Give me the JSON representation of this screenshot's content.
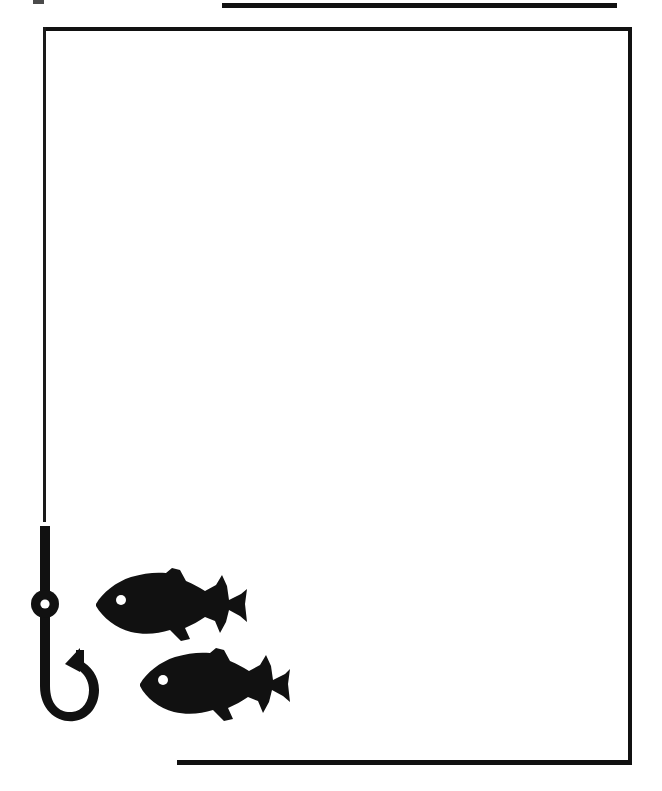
{
  "artwork": {
    "title": "Fishing Page Border",
    "subject": "Fishing hook and two fish silhouettes framing a blank page",
    "style": "black-and-white scanned clip art",
    "medium": "line art silhouette",
    "background_color": "#ffffff",
    "ink_color": "#111111",
    "canvas": {
      "width": 662,
      "height": 791
    }
  },
  "frame": {
    "top_rule": {
      "label": "top horizontal rule",
      "x1": 222,
      "y1": 5,
      "x2": 617,
      "y2": 5,
      "thickness": 5,
      "color": "#111111"
    },
    "left_edge": {
      "label": "left frame edge formed by fishing line",
      "x": 44,
      "y1": 28,
      "y2": 521,
      "thickness": 3,
      "color": "#1a1a1a"
    },
    "top_edge": {
      "label": "top frame edge",
      "x1": 44,
      "x2": 632,
      "y": 29,
      "thickness": 4,
      "color": "#111111"
    },
    "right_edge": {
      "label": "right frame edge",
      "x": 631,
      "y1": 29,
      "y2": 764,
      "thickness": 4,
      "color": "#111111"
    },
    "bottom_edge": {
      "label": "bottom frame edge",
      "x1": 177,
      "x2": 632,
      "y": 763,
      "thickness": 5,
      "color": "#111111"
    },
    "open_corner": "bottom-left",
    "interior_fill": "#ffffff"
  },
  "elements": {
    "hook": {
      "name": "fishing hook",
      "color": "#111111",
      "line_top_y": 28,
      "shank_top_y": 526,
      "shank_bottom_y": 672,
      "shank_x": 48,
      "shank_width": 9,
      "eye": {
        "label": "hook eye",
        "center_x": 48,
        "center_y": 604,
        "outer_radius": 14,
        "hole_radius": 5,
        "hole_color": "#ffffff"
      },
      "bend_bottom_y": 716,
      "point_tip_x": 76,
      "point_tip_y": 652,
      "total_height": 190
    },
    "fish_upper": {
      "name": "upper fish silhouette",
      "color": "#111111",
      "facing": "left",
      "x": 95,
      "y": 568,
      "width": 153,
      "height": 72,
      "eye": {
        "label": "fish eye",
        "center_x": 121,
        "center_y": 600,
        "radius": 5,
        "color": "#ffffff"
      },
      "fins": [
        "dorsal",
        "pelvic",
        "caudal"
      ]
    },
    "fish_lower": {
      "name": "lower fish silhouette",
      "color": "#111111",
      "facing": "left",
      "x": 139,
      "y": 648,
      "width": 151,
      "height": 72,
      "eye": {
        "label": "fish eye",
        "center_x": 163,
        "center_y": 680,
        "radius": 5,
        "color": "#ffffff"
      },
      "fins": [
        "dorsal",
        "pelvic",
        "caudal"
      ]
    },
    "scan_speck": {
      "name": "scan artifact speck",
      "x": 33,
      "y": 0,
      "width": 11,
      "height": 5,
      "color": "#2b2b2b"
    }
  },
  "blank_area": {
    "label": "blank writing area",
    "x": 48,
    "y": 33,
    "width": 580,
    "height": 726
  }
}
